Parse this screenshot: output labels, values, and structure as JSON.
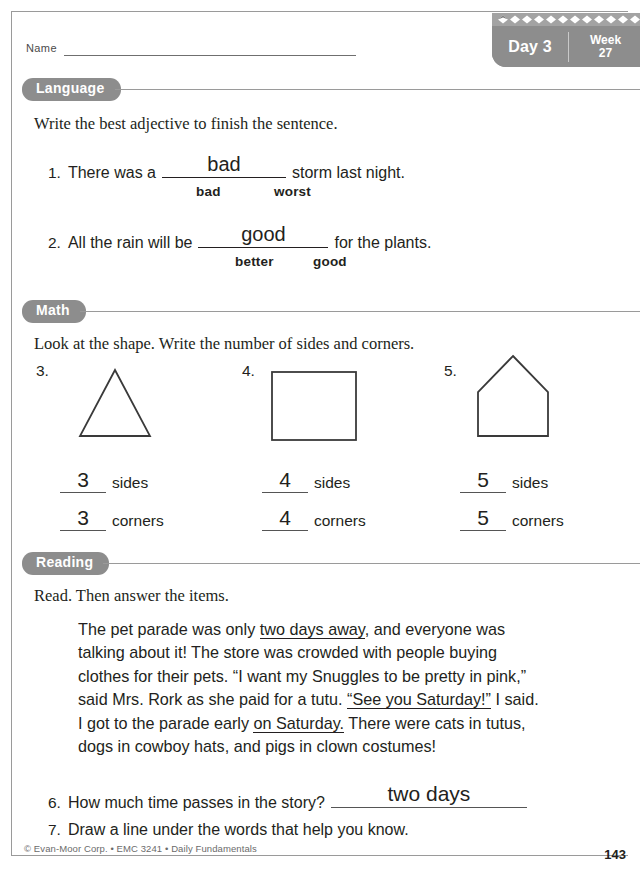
{
  "header": {
    "name_label": "Name",
    "day_label": "Day 3",
    "week_label": "Week",
    "week_number": "27",
    "pattern_icon": "diamond-pattern-icon"
  },
  "sections": {
    "language": {
      "title": "Language",
      "direction": "Write the best adjective to finish the sentence.",
      "items": [
        {
          "number": "1.",
          "before": "There was a",
          "answer": "bad",
          "after": "storm last night.",
          "choices": [
            "bad",
            "worst"
          ]
        },
        {
          "number": "2.",
          "before": "All the rain will be",
          "answer": "good",
          "after": "for the plants.",
          "choices": [
            "better",
            "good"
          ]
        }
      ]
    },
    "math": {
      "title": "Math",
      "direction": "Look at the shape. Write the number of sides and corners.",
      "items": [
        {
          "number": "3.",
          "shape": "triangle-shape",
          "sides_answer": "3",
          "sides_label": "sides",
          "corners_answer": "3",
          "corners_label": "corners"
        },
        {
          "number": "4.",
          "shape": "square-shape",
          "sides_answer": "4",
          "sides_label": "sides",
          "corners_answer": "4",
          "corners_label": "corners"
        },
        {
          "number": "5.",
          "shape": "pentagon-house-shape",
          "sides_answer": "5",
          "sides_label": "sides",
          "corners_answer": "5",
          "corners_label": "corners"
        }
      ]
    },
    "reading": {
      "title": "Reading",
      "direction": "Read. Then answer the items.",
      "passage_lines": [
        [
          {
            "t": "The pet parade was only ",
            "u": false
          },
          {
            "t": "two days away",
            "u": true
          },
          {
            "t": ", and everyone was",
            "u": false
          }
        ],
        [
          {
            "t": "talking about it! The store was crowded with people buying",
            "u": false
          }
        ],
        [
          {
            "t": "clothes for their pets. “I want my Snuggles to be pretty in pink,”",
            "u": false
          }
        ],
        [
          {
            "t": "said Mrs. Rork as she paid for a tutu. ",
            "u": false
          },
          {
            "t": "“See you Saturday!”",
            "u": true
          },
          {
            "t": " I said.",
            "u": false
          }
        ],
        [
          {
            "t": "I got to the parade early ",
            "u": false
          },
          {
            "t": "on Saturday.",
            "u": true
          },
          {
            "t": " There were cats in tutus,",
            "u": false
          }
        ],
        [
          {
            "t": "dogs in cowboy hats, and pigs in clown costumes!",
            "u": false
          }
        ]
      ],
      "items": [
        {
          "number": "6.",
          "question": "How much time passes in the story?",
          "answer": "two days"
        },
        {
          "number": "7.",
          "question": "Draw a line under the words that help you know.",
          "answer": ""
        }
      ]
    }
  },
  "footer": {
    "copyright": "© Evan-Moor Corp. • EMC 3241 • Daily Fundamentals",
    "page_number": "143"
  },
  "colors": {
    "pill_gray": "#8d8d8d",
    "rule_gray": "#9a9a9a",
    "ink": "#231f20"
  }
}
